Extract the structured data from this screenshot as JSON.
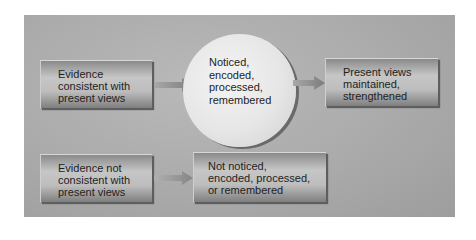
{
  "diagram": {
    "type": "flowchart",
    "nodes": {
      "evidence_consistent": {
        "label": "Evidence\nconsistent with\npresent views",
        "shape": "box"
      },
      "noticed": {
        "label": "Noticed,\nencoded,\nprocessed,\nremembered",
        "shape": "circle"
      },
      "views_maintained": {
        "label": "Present views\nmaintained,\nstrengthened",
        "shape": "box"
      },
      "evidence_inconsistent": {
        "label": "Evidence not\nconsistent with\npresent views",
        "shape": "box"
      },
      "not_noticed": {
        "label": "Not noticed,\nencoded, processed,\nor remembered",
        "shape": "box"
      }
    },
    "edges": [
      {
        "from": "evidence_consistent",
        "to": "noticed"
      },
      {
        "from": "noticed",
        "to": "views_maintained"
      },
      {
        "from": "evidence_inconsistent",
        "to": "not_noticed"
      }
    ],
    "colors": {
      "panel": "#a9a9a9",
      "box": "#bdbdbd",
      "circle": "#e6e6e6",
      "arrow": "#8c8c8c",
      "text": "#1e1e1e"
    }
  }
}
